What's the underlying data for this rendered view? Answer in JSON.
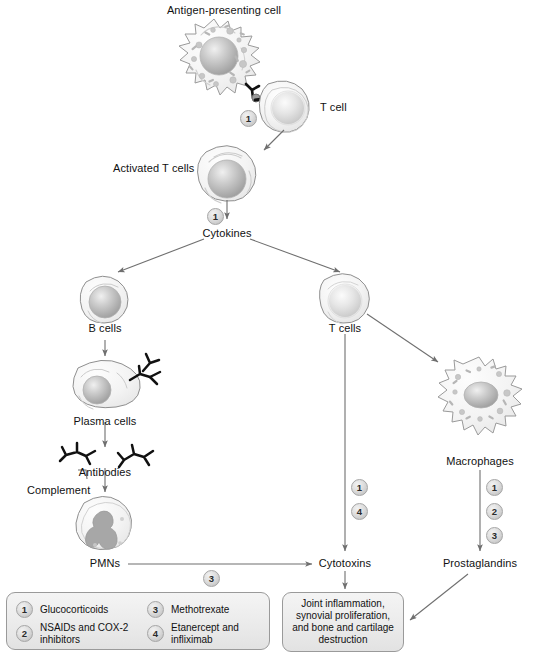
{
  "diagram": {
    "colors": {
      "line": "#6f6f6f",
      "cell_outline": "#9a9a9a",
      "nucleus": "#a9a9a9",
      "box_fill": "#efefef",
      "box_border": "#9a9a9a",
      "text": "#111111"
    },
    "labels": {
      "antigen_presenting_cell": "Antigen-presenting cell",
      "t_cell": "T cell",
      "activated_t_cells": "Activated T cells",
      "cytokines": "Cytokines",
      "b_cells": "B cells",
      "plasma_cells": "Plasma cells",
      "antibodies": "Antibodies",
      "complement": "Complement",
      "pmns": "PMNs",
      "t_cells": "T cells",
      "macrophages": "Macrophages",
      "cytotoxins": "Cytotoxins",
      "prostaglandins": "Prostaglandins"
    },
    "outcome": "Joint inflammation,\nsynovial proliferation,\nand bone and\ncartilage destruction",
    "markers": {
      "apc_t_cell": "1",
      "activated_to_cytokines": "1",
      "pmn_to_cytotoxins": "3",
      "tcell_branch": [
        "1",
        "4"
      ],
      "macrophage_branch": [
        "1",
        "2",
        "3"
      ]
    },
    "legend": [
      {
        "number": "1",
        "label": "Glucocorticoids"
      },
      {
        "number": "2",
        "label": "NSAIDs and COX-2\ninhibitors"
      },
      {
        "number": "3",
        "label": "Methotrexate"
      },
      {
        "number": "4",
        "label": "Etanercept and\ninfliximab"
      }
    ]
  }
}
